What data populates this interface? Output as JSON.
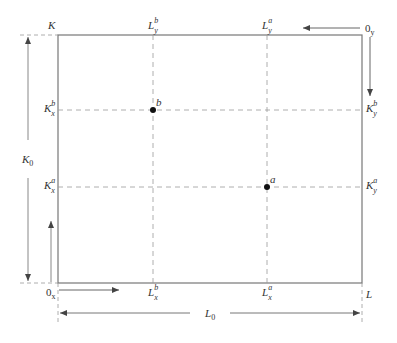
{
  "diagram": {
    "colors": {
      "frame": "#777777",
      "dashed": "#999999",
      "arrow": "#555555",
      "point": "#111111",
      "text": "#333333"
    },
    "corners": {
      "top_left": {
        "base": "K",
        "sub": "",
        "sup": ""
      },
      "top_right_origin": {
        "base": "0",
        "sub": "y",
        "sup": ""
      },
      "bottom_left_origin": {
        "base": "0",
        "sub": "x",
        "sup": ""
      },
      "bottom_right": {
        "base": "L",
        "sub": "",
        "sup": ""
      }
    },
    "top_labels": [
      {
        "base": "L",
        "sub": "y",
        "sup": "b"
      },
      {
        "base": "L",
        "sub": "y",
        "sup": "a"
      }
    ],
    "bottom_labels": [
      {
        "base": "L",
        "sub": "x",
        "sup": "b"
      },
      {
        "base": "L",
        "sub": "x",
        "sup": "a"
      }
    ],
    "left_labels": [
      {
        "base": "K",
        "sub": "x",
        "sup": "b"
      },
      {
        "base": "K",
        "sub": "x",
        "sup": "a"
      }
    ],
    "right_labels": [
      {
        "base": "K",
        "sub": "y",
        "sup": "b"
      },
      {
        "base": "K",
        "sub": "y",
        "sup": "a"
      }
    ],
    "points": [
      {
        "name": "b",
        "label": "b"
      },
      {
        "name": "a",
        "label": "a"
      }
    ],
    "dimension_labels": {
      "height": {
        "base": "K",
        "sub": "0"
      },
      "width": {
        "base": "L",
        "sub": "0"
      }
    }
  }
}
